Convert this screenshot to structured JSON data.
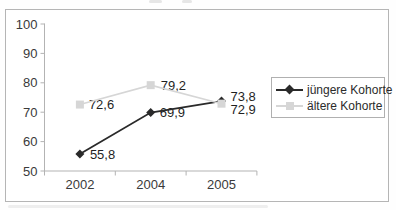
{
  "chart_data": {
    "type": "line",
    "categories": [
      "2002",
      "2004",
      "2005"
    ],
    "series": [
      {
        "name": "jüngere Kohorte",
        "values": [
          55.8,
          69.9,
          73.8
        ],
        "labels": [
          "55,8",
          "69,9",
          "73,8"
        ],
        "color": "#2a2a2a",
        "marker": "diamond",
        "line_width": 1.8,
        "label_offsets": [
          [
            10,
            1
          ],
          [
            9,
            0
          ],
          [
            9,
            -5
          ]
        ]
      },
      {
        "name": "ältere Kohorte",
        "values": [
          72.6,
          79.2,
          72.9
        ],
        "labels": [
          "72,6",
          "79,2",
          "72,9"
        ],
        "color": "#d6d6d6",
        "marker": "square",
        "line_width": 1.6,
        "label_offsets": [
          [
            9,
            0
          ],
          [
            10,
            0
          ],
          [
            9,
            6
          ]
        ]
      }
    ],
    "title": "",
    "xlabel": "",
    "ylabel": "",
    "ylim": [
      50,
      100
    ],
    "yticks": [
      100,
      90,
      80,
      70,
      60,
      50
    ],
    "grid": false,
    "legend_position": "right",
    "axis_color": "#b3b3b3",
    "tick_label_color": "#3a3a3a",
    "data_label_color": "#1f1f1f"
  }
}
